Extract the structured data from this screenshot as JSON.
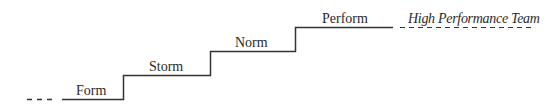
{
  "diagram": {
    "type": "staircase",
    "line_color": "#333333",
    "stages": [
      {
        "label": "Form"
      },
      {
        "label": "Storm"
      },
      {
        "label": "Norm"
      },
      {
        "label": "Perform"
      }
    ],
    "goal": {
      "label": "High Performance Team"
    }
  }
}
